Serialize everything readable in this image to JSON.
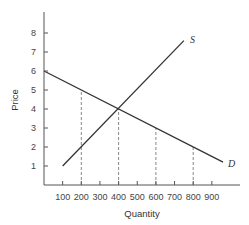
{
  "chart_data": {
    "type": "line",
    "title": "",
    "xlabel": "Quantity",
    "ylabel": "Price",
    "xlim": [
      0,
      1000
    ],
    "ylim": [
      0,
      9
    ],
    "grid": false,
    "legend": "none (curves labeled inline)",
    "x_ticks": [
      100,
      200,
      300,
      400,
      500,
      600,
      700,
      800,
      900
    ],
    "y_ticks": [
      1,
      2,
      3,
      4,
      5,
      6,
      7,
      8
    ],
    "series": [
      {
        "name": "S",
        "label": "S",
        "kind": "supply",
        "points": [
          [
            100,
            1
          ],
          [
            750,
            7.6
          ]
        ]
      },
      {
        "name": "D",
        "label": "D",
        "kind": "demand",
        "points": [
          [
            0,
            6
          ],
          [
            960,
            1.2
          ]
        ]
      }
    ],
    "equilibrium": {
      "quantity": 400,
      "price": 4
    },
    "dashed_guides": [
      {
        "quantity": 200,
        "price": 5
      },
      {
        "quantity": 400,
        "price": 4
      },
      {
        "quantity": 600,
        "price": 3
      },
      {
        "quantity": 800,
        "price": 2
      }
    ]
  },
  "colors": {
    "line": "#333333",
    "axis": "#555555",
    "dashed": "#888888",
    "text": "#444444"
  }
}
